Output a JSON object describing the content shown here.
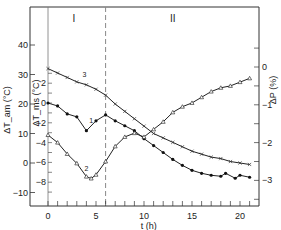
{
  "chart_data": {
    "type": "line",
    "title": "",
    "region_labels": [
      "I",
      "II"
    ],
    "divider_x": 6,
    "xlabel": "t (h)",
    "x_ticks": [
      0,
      5,
      10,
      15,
      20
    ],
    "xlim": [
      -0.8,
      21.5
    ],
    "axes": {
      "left_outer": {
        "label": "ΔT_am (°C)",
        "ticks": [
          -10,
          0,
          10,
          20,
          30,
          40
        ]
      },
      "left_inner": {
        "label": "ΔT_ms (°C)",
        "ticks": [
          -8,
          -6,
          -4,
          -2,
          0,
          2
        ]
      },
      "right": {
        "label": "ΔP (%)",
        "ticks": [
          0,
          -1,
          -2,
          -3
        ]
      }
    },
    "series": [
      {
        "name": "1",
        "axis": "left_inner",
        "marker": "filled-circle",
        "x": [
          0,
          1,
          2,
          3,
          4,
          5,
          6,
          7,
          8,
          9,
          10,
          11,
          12,
          13,
          14,
          15,
          16,
          17,
          18,
          18.5,
          19.5,
          20,
          21
        ],
        "values": [
          0,
          -0.3,
          -1.1,
          -1.4,
          -2.8,
          -1.8,
          -1.2,
          -1.8,
          -2.3,
          -2.8,
          -3.6,
          -4.3,
          -5.0,
          -5.7,
          -6.3,
          -6.8,
          -7.1,
          -7.3,
          -7.4,
          -7.1,
          -7.6,
          -7.3,
          -7.5
        ]
      },
      {
        "name": "2",
        "axis": "right",
        "marker": "open-triangle",
        "x": [
          0,
          1,
          2,
          3,
          4,
          4.5,
          5,
          6,
          7,
          8,
          9,
          10,
          11,
          12,
          13,
          14,
          15,
          16,
          17,
          18,
          19,
          20,
          21
        ],
        "values": [
          -1.8,
          -2.0,
          -2.3,
          -2.55,
          -2.9,
          -2.95,
          -2.85,
          -2.5,
          -2.1,
          -1.85,
          -1.75,
          -1.85,
          -1.65,
          -1.45,
          -1.2,
          -1.05,
          -0.95,
          -0.8,
          -0.65,
          -0.55,
          -0.5,
          -0.4,
          -0.3
        ]
      },
      {
        "name": "3",
        "axis": "left_outer",
        "marker": "cross",
        "x": [
          0,
          1,
          2,
          3,
          4,
          5,
          6,
          7,
          8,
          9,
          10,
          11,
          12,
          13,
          14,
          15,
          16,
          17,
          18,
          19,
          20,
          21
        ],
        "values": [
          32,
          30.5,
          29,
          27.5,
          26.5,
          25,
          23,
          20,
          17.5,
          15,
          12.5,
          10,
          8.5,
          7,
          5.5,
          4,
          3,
          2,
          1.5,
          0.5,
          0,
          -0.5
        ]
      }
    ]
  }
}
